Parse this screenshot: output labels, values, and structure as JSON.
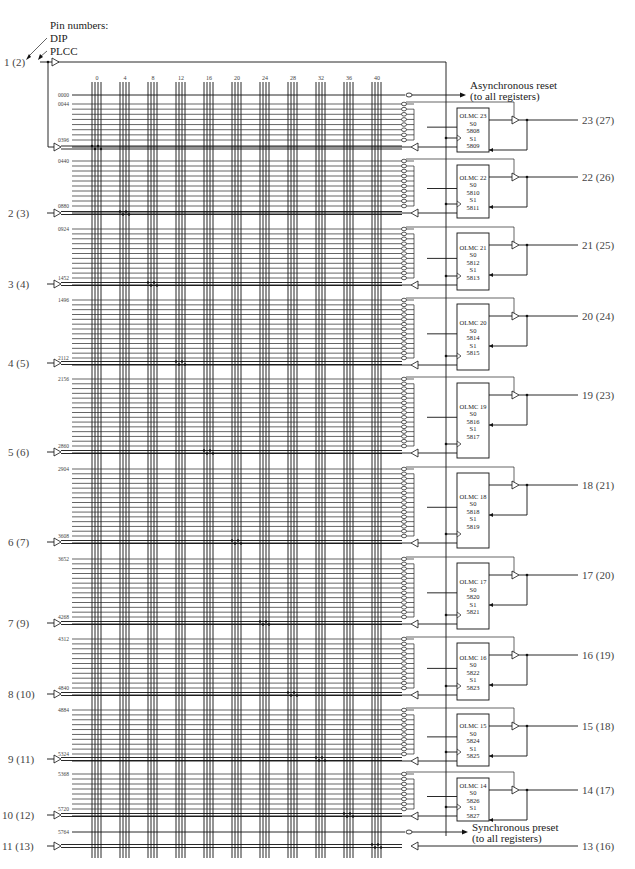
{
  "legend": {
    "title": "Pin numbers:",
    "dip": "DIP",
    "plcc": "PLCC"
  },
  "column_labels": [
    "0",
    "4",
    "8",
    "12",
    "16",
    "20",
    "24",
    "28",
    "32",
    "36",
    "40"
  ],
  "async_reset": {
    "row_label": "0000",
    "line1": "Asynchronous reset",
    "line2": "(to all registers)"
  },
  "sync_preset": {
    "row_label": "5764",
    "line1": "Synchronous preset",
    "line2": "(to all registers)"
  },
  "input_pins": [
    {
      "label": "1 (2)",
      "y": 172
    },
    {
      "label": "2 (3)",
      "y": 213
    },
    {
      "label": "3 (4)",
      "y": 284
    },
    {
      "label": "4 (5)",
      "y": 363
    },
    {
      "label": "5 (6)",
      "y": 452
    },
    {
      "label": "6 (7)",
      "y": 542
    },
    {
      "label": "7 (9)",
      "y": 623
    },
    {
      "label": "8 (10)",
      "y": 694
    },
    {
      "label": "9 (11)",
      "y": 759
    },
    {
      "label": "10 (12)",
      "y": 815
    },
    {
      "label": "11 (13)",
      "y": 846
    }
  ],
  "olmcs": [
    {
      "name": "OLMC 23",
      "s0": "S0",
      "s0_fuse": "5808",
      "s1": "S1",
      "s1_fuse": "5809",
      "pin": "23 (27)",
      "first_row": "0044",
      "last_row": "0396",
      "top": 108,
      "bottom": 152
    },
    {
      "name": "OLMC 22",
      "s0": "S0",
      "s0_fuse": "5810",
      "s1": "S1",
      "s1_fuse": "5811",
      "pin": "22 (26)",
      "first_row": "0440",
      "last_row": "0880",
      "top": 165,
      "bottom": 218
    },
    {
      "name": "OLMC 21",
      "s0": "S0",
      "s0_fuse": "5812",
      "s1": "S1",
      "s1_fuse": "5813",
      "pin": "21 (25)",
      "first_row": "0924",
      "last_row": "1452",
      "top": 233,
      "bottom": 290
    },
    {
      "name": "OLMC 20",
      "s0": "S0",
      "s0_fuse": "5814",
      "s1": "S1",
      "s1_fuse": "5815",
      "pin": "20 (24)",
      "first_row": "1496",
      "last_row": "2112",
      "top": 304,
      "bottom": 370
    },
    {
      "name": "OLMC 19",
      "s0": "S0",
      "s0_fuse": "5816",
      "s1": "S1",
      "s1_fuse": "5817",
      "pin": "19 (23)",
      "first_row": "2156",
      "last_row": "2860",
      "top": 383,
      "bottom": 458
    },
    {
      "name": "OLMC 18",
      "s0": "S0",
      "s0_fuse": "5818",
      "s1": "S1",
      "s1_fuse": "5819",
      "pin": "18 (21)",
      "first_row": "2904",
      "last_row": "3608",
      "top": 473,
      "bottom": 548
    },
    {
      "name": "OLMC 17",
      "s0": "S0",
      "s0_fuse": "5820",
      "s1": "S1",
      "s1_fuse": "5821",
      "pin": "17 (20)",
      "first_row": "3652",
      "last_row": "4268",
      "top": 563,
      "bottom": 629
    },
    {
      "name": "OLMC 16",
      "s0": "S0",
      "s0_fuse": "5822",
      "s1": "S1",
      "s1_fuse": "5823",
      "pin": "16 (19)",
      "first_row": "4312",
      "last_row": "4840",
      "top": 643,
      "bottom": 700
    },
    {
      "name": "OLMC 15",
      "s0": "S0",
      "s0_fuse": "5824",
      "s1": "S1",
      "s1_fuse": "5825",
      "pin": "15 (18)",
      "first_row": "4884",
      "last_row": "5324",
      "top": 714,
      "bottom": 766
    },
    {
      "name": "OLMC 14",
      "s0": "S0",
      "s0_fuse": "5826",
      "s1": "S1",
      "s1_fuse": "5827",
      "pin": "14 (17)",
      "first_row": "5368",
      "last_row": "5720",
      "top": 778,
      "bottom": 821
    }
  ],
  "bottom_pin": {
    "label": "13 (16)",
    "y": 846
  },
  "colors": {
    "line": "#111111",
    "text": "#333333",
    "background": "#ffffff"
  }
}
